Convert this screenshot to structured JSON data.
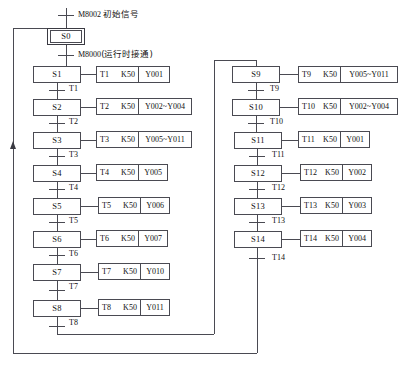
{
  "diagram": {
    "type": "sfc-sequential-function-chart",
    "title_visible": false,
    "header": {
      "initial_signal": {
        "device": "M8002",
        "note": "初始信号"
      },
      "run_signal": {
        "device": "M8000",
        "note": "(运行时接通)"
      }
    },
    "colors": {
      "line": "#4a4a52",
      "text": "#111111",
      "background": "#ffffff"
    },
    "columns": [
      {
        "name": "left-column",
        "steps": [
          {
            "id": "S0",
            "initial": true,
            "x": 47,
            "y": 28,
            "w": 38,
            "h": 17,
            "transition": null,
            "action": null
          },
          {
            "id": "S1",
            "initial": false,
            "x": 33,
            "y": 66,
            "w": 48,
            "h": 17,
            "transition": "T1",
            "action": {
              "x": 96,
              "y": 66,
              "w": 74,
              "h": 17,
              "timer": "T1",
              "preset": "K50",
              "outputs": "Y001"
            }
          },
          {
            "id": "S2",
            "initial": false,
            "x": 33,
            "y": 99,
            "w": 48,
            "h": 17,
            "transition": "T2",
            "action": {
              "x": 96,
              "y": 98,
              "w": 96,
              "h": 17,
              "timer": "T2",
              "preset": "K50",
              "outputs": "Y002~Y004"
            }
          },
          {
            "id": "S3",
            "initial": false,
            "x": 33,
            "y": 132,
            "w": 48,
            "h": 17,
            "transition": "T3",
            "action": {
              "x": 96,
              "y": 131,
              "w": 96,
              "h": 17,
              "timer": "T3",
              "preset": "K50",
              "outputs": "Y005~Y011"
            }
          },
          {
            "id": "S4",
            "initial": false,
            "x": 33,
            "y": 165,
            "w": 48,
            "h": 17,
            "transition": "T4",
            "action": {
              "x": 96,
              "y": 164,
              "w": 72,
              "h": 17,
              "timer": "T4",
              "preset": "K50",
              "outputs": "Y005"
            }
          },
          {
            "id": "S5",
            "initial": false,
            "x": 33,
            "y": 198,
            "w": 48,
            "h": 17,
            "transition": "T5",
            "action": {
              "x": 98,
              "y": 197,
              "w": 72,
              "h": 17,
              "timer": "T5",
              "preset": "K50",
              "outputs": "Y006"
            }
          },
          {
            "id": "S6",
            "initial": false,
            "x": 33,
            "y": 231,
            "w": 48,
            "h": 17,
            "transition": "T6",
            "action": {
              "x": 96,
              "y": 230,
              "w": 72,
              "h": 17,
              "timer": "T6",
              "preset": "K50",
              "outputs": "Y007"
            }
          },
          {
            "id": "S7",
            "initial": false,
            "x": 33,
            "y": 264,
            "w": 48,
            "h": 17,
            "transition": "T7",
            "action": {
              "x": 98,
              "y": 263,
              "w": 72,
              "h": 17,
              "timer": "T7",
              "preset": "K50",
              "outputs": "Y010"
            }
          },
          {
            "id": "S8",
            "initial": false,
            "x": 33,
            "y": 300,
            "w": 48,
            "h": 17,
            "transition": "T8",
            "action": {
              "x": 98,
              "y": 299,
              "w": 72,
              "h": 17,
              "timer": "T8",
              "preset": "K50",
              "outputs": "Y011"
            }
          }
        ]
      },
      {
        "name": "right-column",
        "steps": [
          {
            "id": "S9",
            "initial": false,
            "x": 232,
            "y": 66,
            "w": 48,
            "h": 17,
            "transition": "T9",
            "action": {
              "x": 298,
              "y": 66,
              "w": 100,
              "h": 17,
              "timer": "T9",
              "preset": "K50",
              "outputs": "Y005~Y011"
            }
          },
          {
            "id": "S10",
            "initial": false,
            "x": 232,
            "y": 99,
            "w": 48,
            "h": 17,
            "transition": "T10",
            "action": {
              "x": 298,
              "y": 98,
              "w": 100,
              "h": 17,
              "timer": "T10",
              "preset": "K50",
              "outputs": "Y002~Y004"
            }
          },
          {
            "id": "S11",
            "initial": false,
            "x": 234,
            "y": 132,
            "w": 48,
            "h": 17,
            "transition": "T11",
            "action": {
              "x": 298,
              "y": 131,
              "w": 72,
              "h": 17,
              "timer": "T11",
              "preset": "K50",
              "outputs": "Y001"
            }
          },
          {
            "id": "S12",
            "initial": false,
            "x": 234,
            "y": 165,
            "w": 48,
            "h": 17,
            "transition": "T12",
            "action": {
              "x": 300,
              "y": 164,
              "w": 72,
              "h": 17,
              "timer": "T12",
              "preset": "K50",
              "outputs": "Y002"
            }
          },
          {
            "id": "S13",
            "initial": false,
            "x": 234,
            "y": 198,
            "w": 48,
            "h": 17,
            "transition": "T13",
            "action": {
              "x": 300,
              "y": 197,
              "w": 72,
              "h": 17,
              "timer": "T13",
              "preset": "K50",
              "outputs": "Y003"
            }
          },
          {
            "id": "S14",
            "initial": false,
            "x": 234,
            "y": 231,
            "w": 48,
            "h": 17,
            "transition": "T14",
            "action": {
              "x": 300,
              "y": 230,
              "w": 72,
              "h": 17,
              "timer": "T14",
              "preset": "K50",
              "outputs": "Y004"
            }
          }
        ]
      }
    ],
    "jumps": [
      {
        "name": "left-to-right",
        "from": "T8",
        "to": "S9",
        "note": ""
      },
      {
        "name": "right-to-start",
        "from": "T14",
        "to": "S0",
        "note": ""
      }
    ],
    "frame": {
      "x": 13,
      "y": 21,
      "w": 245,
      "h": 332
    }
  }
}
